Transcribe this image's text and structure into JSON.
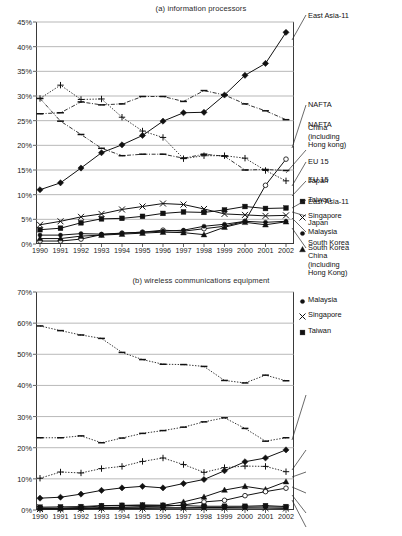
{
  "figure": {
    "width": 402,
    "height": 536,
    "background": "#ffffff",
    "ink": "#111111"
  },
  "chart_data": [
    {
      "id": "a",
      "type": "line",
      "title": "(a) information processors",
      "xlabel": "",
      "ylabel": "",
      "x": [
        1990,
        1991,
        1992,
        1993,
        1994,
        1995,
        1996,
        1997,
        1998,
        1999,
        2000,
        2001,
        2002
      ],
      "xtick_labels": [
        "1990",
        "1991",
        "1992",
        "1993",
        "1994",
        "1995",
        "1996",
        "1997",
        "1998",
        "1999",
        "2000",
        "2001",
        "2002"
      ],
      "ylim": [
        0,
        45
      ],
      "ytick_labels": [
        "0%",
        "5%",
        "10%",
        "15%",
        "20%",
        "25%",
        "30%",
        "35%",
        "40%",
        "45%"
      ],
      "yticks": [
        0,
        5,
        10,
        15,
        20,
        25,
        30,
        35,
        40,
        45
      ],
      "grid": "horizontal",
      "legend_position": "right-outside-with-leader-lines",
      "series": [
        {
          "name": "East Asia-11",
          "marker": "diamond-filled",
          "line": "solid",
          "values": [
            11.0,
            12.4,
            15.4,
            18.5,
            20.1,
            22.0,
            24.9,
            26.6,
            26.7,
            30.2,
            34.2,
            36.6,
            42.9
          ]
        },
        {
          "name": "NAFTA",
          "marker": "dash",
          "line": "dash-dot",
          "values": [
            26.4,
            26.6,
            28.8,
            28.2,
            28.4,
            29.9,
            29.9,
            28.9,
            31.1,
            30.2,
            28.4,
            27.0,
            25.2
          ]
        },
        {
          "name": "China (including Hong kong)",
          "marker": "circle-open",
          "line": "solid",
          "values": [
            0.6,
            0.6,
            1.0,
            1.9,
            2.2,
            2.4,
            2.8,
            2.6,
            3.1,
            3.6,
            4.6,
            11.9,
            17.2
          ]
        },
        {
          "name": "EU 15",
          "marker": "plus",
          "line": "dotted",
          "values": [
            29.5,
            32.2,
            29.3,
            29.4,
            25.7,
            22.9,
            21.6,
            17.3,
            17.9,
            17.9,
            17.4,
            14.9,
            12.8
          ]
        },
        {
          "name": "Japan",
          "marker": "dash",
          "line": "dash-dot",
          "values": [
            29.5,
            24.9,
            22.2,
            19.4,
            17.9,
            18.2,
            18.2,
            17.4,
            18.2,
            17.8,
            15.0,
            15.1,
            14.9
          ]
        },
        {
          "name": "Taiwan",
          "marker": "square-filled",
          "line": "solid",
          "values": [
            2.9,
            3.2,
            4.3,
            5.1,
            5.2,
            5.6,
            6.2,
            6.5,
            6.4,
            6.9,
            7.6,
            7.2,
            7.3
          ]
        },
        {
          "name": "Singapore",
          "marker": "x-cross",
          "line": "solid",
          "values": [
            3.9,
            4.6,
            5.5,
            6.1,
            7.0,
            7.6,
            8.2,
            8.0,
            7.1,
            6.1,
            5.9,
            5.7,
            5.8
          ]
        },
        {
          "name": "Malaysia",
          "marker": "circle-small-filled",
          "line": "solid",
          "values": [
            1.8,
            1.8,
            2.1,
            2.0,
            2.2,
            2.4,
            2.6,
            2.8,
            3.6,
            4.0,
            4.6,
            4.4,
            4.6
          ]
        },
        {
          "name": "South Korea",
          "marker": "triangle-filled",
          "line": "solid",
          "values": [
            1.1,
            1.1,
            1.6,
            1.8,
            2.0,
            2.2,
            2.4,
            2.3,
            1.9,
            3.4,
            4.4,
            3.9,
            4.5
          ]
        }
      ],
      "legend_entries": [
        {
          "label": "East Asia-11",
          "marker": "none",
          "leader": true
        },
        {
          "label": "NAFTA",
          "marker": "none",
          "leader": true
        },
        {
          "label": "China\n(including\nHong kong)",
          "marker": "none",
          "leader": true
        },
        {
          "label": "EU 15",
          "marker": "none",
          "leader": true
        },
        {
          "label": "Japan",
          "marker": "none",
          "leader": true
        },
        {
          "label": "Taiwan",
          "marker": "square-filled",
          "leader": true
        },
        {
          "label": "Singapore",
          "marker": "x-cross",
          "leader": true
        },
        {
          "label": "Malaysia",
          "marker": "circle-small-filled",
          "leader": true
        },
        {
          "label": "South Korea",
          "marker": "triangle-filled",
          "leader": true
        }
      ]
    },
    {
      "id": "b",
      "type": "line",
      "title": "(b) wireless communications equipment",
      "xlabel": "",
      "ylabel": "",
      "x": [
        1990,
        1991,
        1992,
        1993,
        1994,
        1995,
        1996,
        1997,
        1998,
        1999,
        2000,
        2001,
        2002
      ],
      "xtick_labels": [
        "1990",
        "1991",
        "1992",
        "1993",
        "1994",
        "1995",
        "1996",
        "1997",
        "1998",
        "1999",
        "2000",
        "2001",
        "2002"
      ],
      "ylim": [
        0,
        70
      ],
      "ytick_labels": [
        "0%",
        "10%",
        "20%",
        "30%",
        "40%",
        "50%",
        "60%",
        "70%"
      ],
      "yticks": [
        0,
        10,
        20,
        30,
        40,
        50,
        60,
        70
      ],
      "grid": "horizontal",
      "legend_position": "right-outside-with-leader-lines",
      "series": [
        {
          "name": "NAFTA",
          "marker": "dash",
          "line": "dotted",
          "values": [
            59.1,
            57.6,
            56.2,
            55.1,
            50.6,
            48.3,
            46.8,
            46.7,
            46.1,
            41.6,
            40.8,
            43.3,
            41.5
          ]
        },
        {
          "name": "EU 15",
          "marker": "dash",
          "line": "dotted",
          "values": [
            23.2,
            23.2,
            23.8,
            21.6,
            23.1,
            24.6,
            25.5,
            26.6,
            28.3,
            29.6,
            26.2,
            22.1,
            23.2
          ]
        },
        {
          "name": "East Asia-11",
          "marker": "diamond-filled",
          "line": "solid",
          "values": [
            3.8,
            4.1,
            5.1,
            6.3,
            7.1,
            7.6,
            7.1,
            8.5,
            9.8,
            12.6,
            15.5,
            16.7,
            19.3
          ]
        },
        {
          "name": "Japan",
          "marker": "plus",
          "line": "dotted",
          "values": [
            10.2,
            12.2,
            11.9,
            13.3,
            14.0,
            15.6,
            16.7,
            14.6,
            12.1,
            13.6,
            14.1,
            14.0,
            12.3
          ]
        },
        {
          "name": "South Korea",
          "marker": "triangle-filled",
          "line": "solid",
          "values": [
            0.6,
            0.6,
            0.8,
            1.3,
            1.4,
            1.5,
            1.5,
            2.6,
            4.2,
            6.4,
            7.6,
            6.6,
            9.1
          ]
        },
        {
          "name": "China (including Hong Kong)",
          "marker": "circle-open",
          "line": "solid",
          "values": [
            0.4,
            0.4,
            0.5,
            0.7,
            0.9,
            1.1,
            1.2,
            1.6,
            2.6,
            3.1,
            4.6,
            5.9,
            7.0
          ]
        },
        {
          "name": "Malaysia",
          "marker": "circle-small-filled",
          "line": "solid",
          "values": [
            0.5,
            0.5,
            0.6,
            0.7,
            0.7,
            0.7,
            0.7,
            0.7,
            0.8,
            0.8,
            0.9,
            1.0,
            0.9
          ]
        },
        {
          "name": "Singapore",
          "marker": "x-cross",
          "line": "solid",
          "values": [
            0.3,
            0.3,
            0.4,
            0.5,
            0.5,
            0.5,
            0.6,
            0.6,
            0.6,
            0.6,
            0.6,
            0.6,
            0.5
          ]
        },
        {
          "name": "Taiwan",
          "marker": "square-filled",
          "line": "solid",
          "values": [
            0.9,
            1.0,
            1.1,
            1.4,
            1.5,
            1.6,
            1.5,
            1.4,
            1.2,
            1.2,
            1.2,
            1.4,
            1.1
          ]
        }
      ],
      "legend_entries": [
        {
          "label": "NAFTA",
          "marker": "none",
          "leader": true
        },
        {
          "label": "EU 15",
          "marker": "none",
          "leader": true
        },
        {
          "label": "East Asia-11",
          "marker": "none",
          "leader": true
        },
        {
          "label": "Japan",
          "marker": "none",
          "leader": true
        },
        {
          "label": "South Korea",
          "marker": "none",
          "leader": true
        },
        {
          "label": "China\n(including\nHong Kong)",
          "marker": "none",
          "leader": true
        },
        {
          "label": "Malaysia",
          "marker": "circle-small-filled",
          "leader": true
        },
        {
          "label": "Singapore",
          "marker": "x-cross",
          "leader": true
        },
        {
          "label": "Taiwan",
          "marker": "square-filled",
          "leader": true
        }
      ]
    }
  ]
}
